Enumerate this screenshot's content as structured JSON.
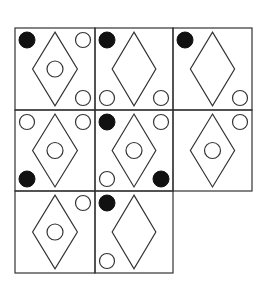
{
  "puzzle": {
    "description": "3x3 figure-reasoning grid with one missing cell (bottom-right)",
    "rows": 3,
    "cols": 3,
    "grid": {
      "col_edges": [
        15,
        95,
        173,
        252
      ],
      "row_edges": [
        28,
        110,
        191,
        273
      ],
      "stroke": "#333333",
      "stroke_width": 1.2
    },
    "colors": {
      "line": "#333333",
      "filled": "#111111",
      "background": "#ffffff"
    },
    "cells": [
      {
        "row": 0,
        "col": 0,
        "diamond": true,
        "inner_circle": true,
        "corners": {
          "tl": "filled",
          "tr": "hollow",
          "bl": null,
          "br": "hollow"
        }
      },
      {
        "row": 0,
        "col": 1,
        "diamond": true,
        "inner_circle": false,
        "corners": {
          "tl": "filled",
          "tr": null,
          "bl": "hollow",
          "br": "hollow"
        }
      },
      {
        "row": 0,
        "col": 2,
        "diamond": true,
        "inner_circle": false,
        "corners": {
          "tl": "filled",
          "tr": null,
          "bl": null,
          "br": "hollow"
        }
      },
      {
        "row": 1,
        "col": 0,
        "diamond": true,
        "inner_circle": true,
        "corners": {
          "tl": "hollow",
          "tr": "hollow",
          "bl": "filled",
          "br": null
        }
      },
      {
        "row": 1,
        "col": 1,
        "diamond": true,
        "inner_circle": true,
        "corners": {
          "tl": "filled",
          "tr": "hollow",
          "bl": "hollow",
          "br": "filled"
        }
      },
      {
        "row": 1,
        "col": 2,
        "diamond": true,
        "inner_circle": true,
        "corners": {
          "tl": null,
          "tr": "hollow",
          "bl": null,
          "br": null
        }
      },
      {
        "row": 2,
        "col": 0,
        "diamond": true,
        "inner_circle": true,
        "corners": {
          "tl": null,
          "tr": "hollow",
          "bl": null,
          "br": null
        }
      },
      {
        "row": 2,
        "col": 1,
        "diamond": true,
        "inner_circle": false,
        "corners": {
          "tl": "filled",
          "tr": null,
          "bl": "hollow",
          "br": null
        }
      },
      {
        "row": 2,
        "col": 2,
        "missing": true
      }
    ]
  }
}
